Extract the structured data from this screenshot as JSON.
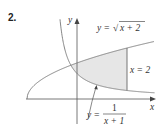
{
  "problem_number": "2.",
  "axes": {
    "x_label": "x",
    "y_label": "y"
  },
  "curves": {
    "upper": {
      "label_prefix": "y = ",
      "label_radicand": "x + 2",
      "expression": "sqrt(x+2)"
    },
    "lower": {
      "label_prefix": "y = ",
      "numerator": "1",
      "denominator": "x + 1",
      "expression": "1/(x+1)"
    }
  },
  "boundary": {
    "label": "x = 2",
    "x": 2
  },
  "region": {
    "description": "shaded region between y=sqrt(x+2) and y=1/(x+1) from their intersection... to x=2",
    "x_from": 0,
    "x_to": 2
  },
  "colors": {
    "shade": "#e6e6e6",
    "curve": "#777777",
    "axis": "#555555"
  }
}
